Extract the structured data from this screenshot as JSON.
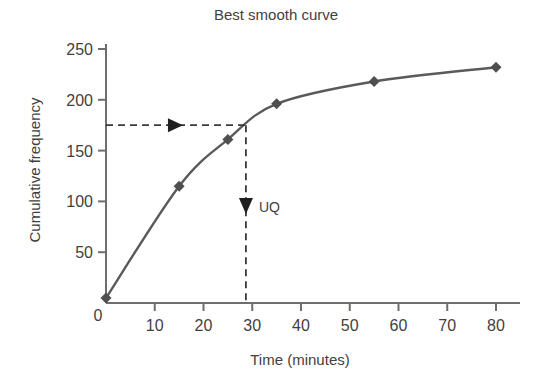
{
  "chart_data": {
    "type": "line",
    "title": "Best smooth curve",
    "xlabel": "Time (minutes)",
    "ylabel": "Cumulative frequency",
    "xlim": [
      0,
      82
    ],
    "ylim": [
      0,
      255
    ],
    "grid": false,
    "legend": "none",
    "x_ticks": [
      10,
      20,
      30,
      40,
      50,
      60,
      70,
      80
    ],
    "x_tick_labels": [
      "10",
      "20",
      "30",
      "40",
      "50",
      "60",
      "70",
      "80"
    ],
    "y_ticks": [
      50,
      100,
      150,
      200,
      250
    ],
    "y_tick_labels": [
      "50",
      "100",
      "150",
      "200",
      "250"
    ],
    "origin_label": "0",
    "series": [
      {
        "name": "Cumulative frequency",
        "marker": "diamond",
        "color": "#5a5a5a",
        "x": [
          0,
          15,
          25,
          35,
          55,
          80
        ],
        "values": [
          5,
          115,
          161,
          196,
          218,
          232
        ]
      }
    ],
    "annotations": [
      {
        "name": "uq-guide-horizontal",
        "type": "dashed-arrow-horizontal",
        "y_value": 175,
        "x_from": 0,
        "x_to": 28.7,
        "label": ""
      },
      {
        "name": "uq-guide-vertical",
        "type": "dashed-arrow-vertical",
        "x_value": 28.7,
        "y_from": 175,
        "y_to": 0,
        "label": "UQ"
      }
    ]
  },
  "colors": {
    "curve": "#5a5a5a",
    "marker": "#4f4f4f",
    "axis": "#6e6e6e",
    "annotation": "#3a3a3a",
    "text": "#3f3f3f",
    "background": "#ffffff"
  }
}
